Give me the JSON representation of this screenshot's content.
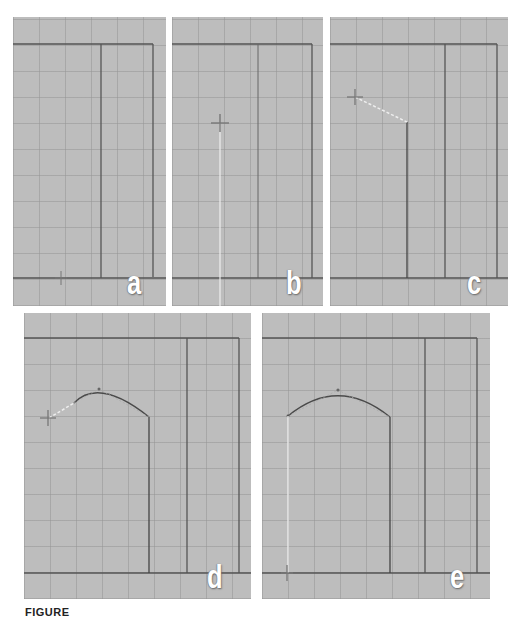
{
  "figure": {
    "caption_prefix": "FIGURE",
    "caption_text": "",
    "colors": {
      "viewport_bg": "#bdbdbd",
      "grid": "#969696",
      "frame_line": "#555555",
      "rubber_band": "#eeeeee",
      "curve": "#4a4a4a",
      "label": "#ffffff"
    }
  },
  "panels": [
    {
      "id": "a",
      "label": "a",
      "description": "Empty viewport with frame; cursor placed at bottom ground line"
    },
    {
      "id": "b",
      "label": "b",
      "description": "Cursor moved up, rubber-band vertical line drawn from bottom"
    },
    {
      "id": "c",
      "label": "c",
      "description": "Vertical line placed; rubber-band segment to cursor at upper left"
    },
    {
      "id": "d",
      "label": "d",
      "description": "Curved arch segment drawn; cursor at left end point"
    },
    {
      "id": "e",
      "label": "e",
      "description": "Left vertical line drawn down to ground line, completing arch outline"
    }
  ]
}
